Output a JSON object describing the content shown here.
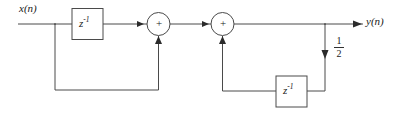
{
  "diagram": {
    "type": "block-diagram",
    "line_color": "#4a4a4a",
    "text_color": "#1a1a1a",
    "background": "#ffffff",
    "input": {
      "label": "x(n)",
      "base": "x",
      "arg": "(n)"
    },
    "output": {
      "label": "y(n)",
      "base": "y",
      "arg": "(n)"
    },
    "delay_blocks": [
      {
        "id": "delay-top",
        "base": "z",
        "exponent": "-1",
        "label": "z-1"
      },
      {
        "id": "delay-bottom",
        "base": "z",
        "exponent": "-1",
        "label": "z-1"
      }
    ],
    "adders": [
      {
        "id": "adder-1",
        "symbol": "+"
      },
      {
        "id": "adder-2",
        "symbol": "+"
      }
    ],
    "gain": {
      "id": "gain-half",
      "numerator": "1",
      "denominator": "2",
      "label": "1/2"
    }
  }
}
